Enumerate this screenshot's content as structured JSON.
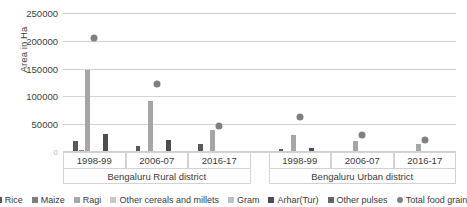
{
  "chart_data": {
    "type": "bar",
    "title": "",
    "xlabel": "",
    "ylabel": "Area in Ha",
    "ylim": [
      0,
      250000
    ],
    "ytick_values": [
      0,
      50000,
      100000,
      150000,
      200000,
      250000
    ],
    "ytick_labels": [
      "0",
      "50000",
      "100000",
      "150000",
      "200000",
      "250000"
    ],
    "grid": true,
    "legend_position": "bottom",
    "categories": [
      "1998-99",
      "2006-07",
      "2016-17",
      "1998-99",
      "2006-07",
      "2016-17"
    ],
    "groups": [
      {
        "label": "Bengaluru Rural district",
        "categories": [
          "1998-99",
          "2006-07",
          "2016-17"
        ]
      },
      {
        "label": "Bengaluru Urban district",
        "categories": [
          "1998-99",
          "2006-07",
          "2016-17"
        ]
      }
    ],
    "series": [
      {
        "name": "Rice",
        "type": "bar",
        "color": "#595959",
        "values": [
          20000,
          10000,
          14000,
          6000,
          1500,
          2500
        ]
      },
      {
        "name": "Maize",
        "type": "bar",
        "color": "#7f7f7f",
        "values": [
          3000,
          1500,
          1000,
          500,
          400,
          400
        ]
      },
      {
        "name": "Ragi",
        "type": "bar",
        "color": "#a6a6a6",
        "values": [
          148000,
          91000,
          40000,
          30000,
          19000,
          14000
        ]
      },
      {
        "name": "Other cereals and millets",
        "type": "bar",
        "color": "#c9c9c9",
        "values": [
          2500,
          1200,
          800,
          600,
          300,
          300
        ]
      },
      {
        "name": "Gram",
        "type": "bar",
        "color": "#bfbfbf",
        "values": [
          900,
          600,
          400,
          300,
          200,
          200
        ]
      },
      {
        "name": "Arhar(Tur)",
        "type": "bar",
        "color": "#4d4d4d",
        "values": [
          33000,
          21000,
          2500,
          8000,
          2000,
          2000
        ]
      },
      {
        "name": "Other pulses",
        "type": "bar",
        "color": "#666666",
        "values": [
          2000,
          1200,
          2000,
          900,
          500,
          600
        ]
      },
      {
        "name": "Total food grain",
        "type": "scatter",
        "color": "#808080",
        "values": [
          211000,
          128000,
          53000,
          70000,
          36000,
          28000
        ]
      }
    ]
  },
  "legend": {
    "items": [
      {
        "label": "Rice",
        "marker": "square-swatch-icon"
      },
      {
        "label": "Maize",
        "marker": "square-swatch-icon"
      },
      {
        "label": "Ragi",
        "marker": "square-swatch-icon"
      },
      {
        "label": "Other cereals and millets",
        "marker": "square-swatch-icon"
      },
      {
        "label": "Gram",
        "marker": "square-swatch-icon"
      },
      {
        "label": "Arhar(Tur)",
        "marker": "square-swatch-icon"
      },
      {
        "label": "Other pulses",
        "marker": "square-swatch-icon"
      },
      {
        "label": "Total food grain",
        "marker": "circle-marker-icon"
      }
    ]
  }
}
